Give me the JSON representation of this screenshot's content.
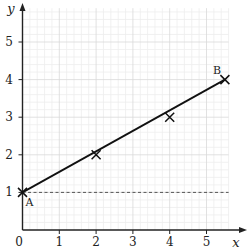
{
  "chart_data": {
    "type": "line",
    "title": "",
    "xlabel": "x",
    "ylabel": "y",
    "xlim": [
      0,
      5.6
    ],
    "ylim": [
      0,
      5.9
    ],
    "x_ticks": [
      0,
      1,
      2,
      3,
      4,
      5
    ],
    "y_ticks": [
      1,
      2,
      3,
      4,
      5
    ],
    "origin_label": "0",
    "grid": true,
    "minor_grid_step": 0.2,
    "legend": null,
    "series": [
      {
        "name": "AB",
        "style": "solid",
        "color": "#111111",
        "x": [
          0,
          5.5
        ],
        "y": [
          1,
          4
        ],
        "markers": [
          {
            "x": 0,
            "y": 1,
            "label": "A"
          },
          {
            "x": 2,
            "y": 2,
            "label": ""
          },
          {
            "x": 4,
            "y": 3,
            "label": ""
          },
          {
            "x": 5.5,
            "y": 4,
            "label": "B"
          }
        ]
      },
      {
        "name": "y=1",
        "style": "dashed",
        "color": "#555555",
        "x": [
          0,
          5.6
        ],
        "y": [
          1,
          1
        ]
      }
    ]
  },
  "colors": {
    "axis": "#222222",
    "grid_major": "#d9d9d9",
    "grid_minor": "#eeeeee",
    "line": "#111111",
    "dashed": "#555555"
  }
}
